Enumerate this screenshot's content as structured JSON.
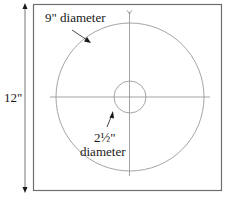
{
  "diagram": {
    "type": "template-measurement",
    "labels": {
      "height": "12\"",
      "outer_diameter_line1": "9\" diameter",
      "inner_diameter_line1": "2½\"",
      "inner_diameter_line2": "diameter"
    },
    "dimensions": {
      "square_side_in": 12,
      "outer_circle_diameter_in": 9,
      "inner_circle_diameter_in": 2.5
    },
    "colors": {
      "square_stroke": "#6e6e6e",
      "circle_stroke": "#9a9a9a",
      "crosshair_stroke": "#8c8c8c",
      "arrow": "#1a1a1a",
      "text": "#1a1a1a"
    }
  }
}
